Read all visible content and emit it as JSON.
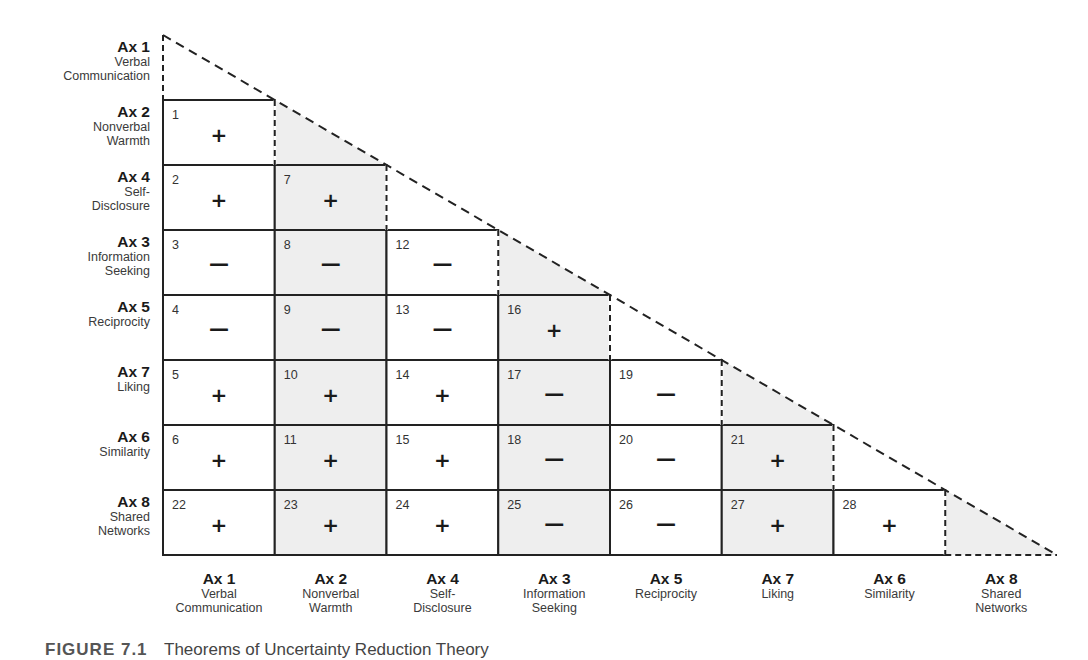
{
  "title": "Theorems of Uncertainty Reduction Theory",
  "caption": {
    "figure_label": "FIGURE 7.1",
    "text": "Theorems of Uncertainty Reduction Theory"
  },
  "layout": {
    "origin_x": 163,
    "top_y": 35,
    "first_row_y": 100,
    "col_width": 111.75,
    "row_height": 65,
    "shade_color": "#eeeeee",
    "line_color": "#222222"
  },
  "row_axes": [
    {
      "ax": "Ax 1",
      "lines": [
        "Verbal",
        "Communication"
      ]
    },
    {
      "ax": "Ax 2",
      "lines": [
        "Nonverbal",
        "Warmth"
      ]
    },
    {
      "ax": "Ax 4",
      "lines": [
        "Self-",
        "Disclosure"
      ]
    },
    {
      "ax": "Ax 3",
      "lines": [
        "Information",
        "Seeking"
      ]
    },
    {
      "ax": "Ax 5",
      "lines": [
        "Reciprocity"
      ]
    },
    {
      "ax": "Ax 7",
      "lines": [
        "Liking"
      ]
    },
    {
      "ax": "Ax 6",
      "lines": [
        "Similarity"
      ]
    },
    {
      "ax": "Ax 8",
      "lines": [
        "Shared",
        "Networks"
      ]
    }
  ],
  "col_axes": [
    {
      "ax": "Ax 1",
      "lines": [
        "Verbal",
        "Communication"
      ],
      "shaded": false
    },
    {
      "ax": "Ax 2",
      "lines": [
        "Nonverbal",
        "Warmth"
      ],
      "shaded": true
    },
    {
      "ax": "Ax 4",
      "lines": [
        "Self-",
        "Disclosure"
      ],
      "shaded": false
    },
    {
      "ax": "Ax 3",
      "lines": [
        "Information",
        "Seeking"
      ],
      "shaded": true
    },
    {
      "ax": "Ax 5",
      "lines": [
        "Reciprocity"
      ],
      "shaded": false
    },
    {
      "ax": "Ax 7",
      "lines": [
        "Liking"
      ],
      "shaded": true
    },
    {
      "ax": "Ax 6",
      "lines": [
        "Similarity"
      ],
      "shaded": false
    },
    {
      "ax": "Ax 8",
      "lines": [
        "Shared",
        "Networks"
      ],
      "shaded": true
    }
  ],
  "theorems": [
    [
      {
        "n": "1",
        "sign": "+"
      }
    ],
    [
      {
        "n": "2",
        "sign": "+"
      },
      {
        "n": "7",
        "sign": "+"
      }
    ],
    [
      {
        "n": "3",
        "sign": "−"
      },
      {
        "n": "8",
        "sign": "−"
      },
      {
        "n": "12",
        "sign": "−"
      }
    ],
    [
      {
        "n": "4",
        "sign": "−"
      },
      {
        "n": "9",
        "sign": "−"
      },
      {
        "n": "13",
        "sign": "−"
      },
      {
        "n": "16",
        "sign": "+"
      }
    ],
    [
      {
        "n": "5",
        "sign": "+"
      },
      {
        "n": "10",
        "sign": "+"
      },
      {
        "n": "14",
        "sign": "+"
      },
      {
        "n": "17",
        "sign": "−"
      },
      {
        "n": "19",
        "sign": "−"
      }
    ],
    [
      {
        "n": "6",
        "sign": "+"
      },
      {
        "n": "11",
        "sign": "+"
      },
      {
        "n": "15",
        "sign": "+"
      },
      {
        "n": "18",
        "sign": "−"
      },
      {
        "n": "20",
        "sign": "−"
      },
      {
        "n": "21",
        "sign": "+"
      }
    ],
    [
      {
        "n": "22",
        "sign": "+"
      },
      {
        "n": "23",
        "sign": "+"
      },
      {
        "n": "24",
        "sign": "+"
      },
      {
        "n": "25",
        "sign": "−"
      },
      {
        "n": "26",
        "sign": "−"
      },
      {
        "n": "27",
        "sign": "+"
      },
      {
        "n": "28",
        "sign": "+"
      }
    ]
  ]
}
